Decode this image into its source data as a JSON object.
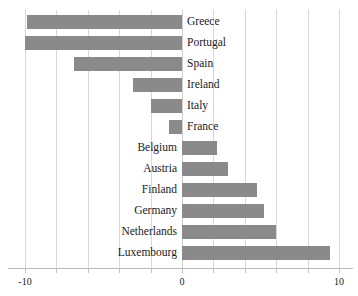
{
  "chart_data": {
    "type": "bar",
    "orientation": "horizontal",
    "title": "",
    "subtitle": "",
    "xlabel": "",
    "ylabel": "",
    "xlim": [
      -10.8,
      11.2
    ],
    "xticks": [
      -10,
      0,
      10
    ],
    "xtick_labels": [
      "-10",
      "0",
      "10"
    ],
    "gridlines": [
      -10,
      -8,
      -6,
      -4,
      -2,
      0,
      2,
      4,
      6,
      8,
      10
    ],
    "grid": true,
    "legend": "none",
    "bar_color": "#8a8a8a",
    "grid_color": "#d8d8d8",
    "axis_color": "#b9b9b9",
    "text_color": "#1a1a1a",
    "background": "#ffffff",
    "categories": [
      "Greece",
      "Portugal",
      "Spain",
      "Ireland",
      "Italy",
      "France",
      "Belgium",
      "Austria",
      "Finland",
      "Germany",
      "Netherlands",
      "Luxembourg"
    ],
    "values": [
      -9.9,
      -10.0,
      -6.9,
      -3.1,
      -2.0,
      -0.8,
      2.2,
      2.9,
      4.8,
      5.2,
      6.0,
      9.4
    ]
  },
  "axis": {
    "ticks": [
      {
        "label": "-10",
        "value": -10
      },
      {
        "label": "0",
        "value": 0
      },
      {
        "label": "10",
        "value": 10
      }
    ]
  }
}
